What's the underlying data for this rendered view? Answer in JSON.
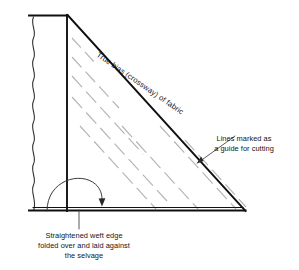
{
  "figure": {
    "background_color": "#ffffff",
    "ink_color": "#101010",
    "guide_line_color": "#b4b4b4"
  },
  "labels": {
    "bias": {
      "text": "True bias (crossway) of fabric",
      "rotation_deg": 34.5,
      "position": {
        "x": 96,
        "y": 60
      }
    },
    "guide_lines": {
      "line1": "Lines marked as",
      "line2": "a guide for cutting",
      "position": {
        "x": 244,
        "y": 142
      }
    },
    "weft_edge": {
      "line1": "Straightened weft edge",
      "line2": "folded over and laid against",
      "line3": "the selvage",
      "position": {
        "x": 84,
        "y": 238
      }
    }
  },
  "shapes": {
    "triangle": {
      "apex_top": {
        "x": 67,
        "y": 15
      },
      "apex_right": {
        "x": 245,
        "y": 211
      },
      "corner_bottom": {
        "x": 67,
        "y": 211
      }
    },
    "selvage_line": {
      "x": 67,
      "y_top": 15,
      "y_bottom": 211
    },
    "top_edge": {
      "x_left": 29,
      "x_right": 67,
      "y": 15
    },
    "bottom_edge": {
      "x_left": 29,
      "x_right": 245,
      "y": 211
    },
    "raw_wavy_edge": {
      "x": 33,
      "y_top": 16,
      "y_bottom": 210,
      "waves": 14
    },
    "fold_arc": {
      "start": {
        "x": 48,
        "y": 210
      },
      "end": {
        "x": 101,
        "y": 204
      },
      "peak_y": 174,
      "arrow_direction": "down-right"
    },
    "guide_lines_count": 7,
    "guide_line_angle_deg": 47.7
  },
  "icons": {
    "arrow": "arrow-icon",
    "fold-arc": "rotation-arc-icon"
  }
}
